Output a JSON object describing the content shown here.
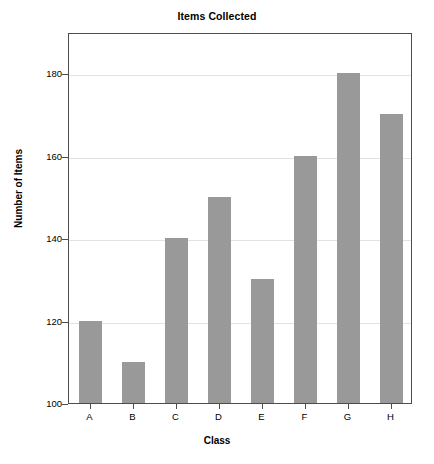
{
  "chart_data": {
    "type": "bar",
    "title": "Items Collected",
    "xlabel": "Class",
    "ylabel": "Number of Items",
    "categories": [
      "A",
      "B",
      "C",
      "D",
      "E",
      "F",
      "G",
      "H"
    ],
    "values": [
      120,
      110,
      140,
      150,
      130,
      160,
      180,
      170
    ],
    "ylim": [
      100,
      190
    ],
    "yticks": [
      100,
      120,
      140,
      160,
      180
    ],
    "ytick_labels": [
      "100",
      "120",
      "140",
      "160",
      "180"
    ],
    "grid": true,
    "legend": false,
    "bar_color": "#999999",
    "grid_color": "#e2e2e2",
    "axis_color": "#4d4d4d",
    "background_color": "#ffffff"
  }
}
